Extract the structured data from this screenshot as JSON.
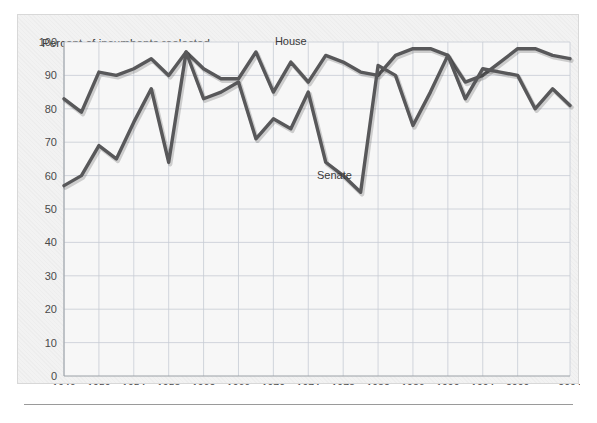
{
  "chart_data": {
    "type": "line",
    "title": "Percent of incumbents reelected",
    "xlabel": "",
    "ylabel": "",
    "ylim": [
      0,
      100
    ],
    "ytick_step": 10,
    "yticks": [
      0,
      10,
      20,
      30,
      40,
      50,
      60,
      70,
      80,
      90,
      100
    ],
    "xlim": [
      1946,
      2004
    ],
    "xtick_labels": [
      "1946",
      "1950",
      "1954",
      "1958",
      "1962",
      "1966",
      "1970",
      "1974",
      "1978",
      "1982",
      "1986",
      "1990",
      "1994",
      "2000",
      "2004"
    ],
    "xtick_values": [
      1946,
      1950,
      1954,
      1958,
      1962,
      1966,
      1970,
      1974,
      1978,
      1982,
      1986,
      1990,
      1994,
      1998,
      2004
    ],
    "x": [
      1946,
      1948,
      1950,
      1952,
      1954,
      1956,
      1958,
      1960,
      1962,
      1964,
      1966,
      1968,
      1970,
      1972,
      1974,
      1976,
      1978,
      1980,
      1982,
      1984,
      1986,
      1988,
      1990,
      1992,
      1994,
      1996,
      1998,
      2000,
      2002,
      2004
    ],
    "grid": true,
    "legend_position": "inline-annotations",
    "series": [
      {
        "name": "House",
        "label_x": 1972,
        "label_y": 99,
        "color": "#58585a",
        "values": [
          83,
          79,
          91,
          90,
          92,
          95,
          90,
          97,
          92,
          89,
          89,
          97,
          85,
          94,
          88,
          96,
          94,
          91,
          90,
          96,
          98,
          98,
          96,
          88,
          90,
          94,
          98,
          98,
          96,
          95
        ]
      },
      {
        "name": "Senate",
        "label_x": 1977,
        "label_y": 59,
        "color": "#58585a",
        "values": [
          57,
          60,
          69,
          65,
          76,
          86,
          64,
          97,
          83,
          85,
          88,
          71,
          77,
          74,
          85,
          64,
          60,
          55,
          93,
          90,
          75,
          85,
          96,
          83,
          92,
          91,
          90,
          80,
          86,
          81
        ]
      }
    ],
    "annotations": [
      {
        "text": "House",
        "x": 1972,
        "y": 99
      },
      {
        "text": "Senate",
        "x": 1977,
        "y": 59
      }
    ]
  },
  "axis": {
    "y_labels": [
      "100",
      "90",
      "80",
      "70",
      "60",
      "50",
      "40",
      "30",
      "20",
      "10",
      "0"
    ],
    "x_labels": [
      "1946",
      "1950",
      "1954",
      "1958",
      "1962",
      "1966",
      "1970",
      "1974",
      "1978",
      "1982",
      "1986",
      "1990",
      "1994",
      "2000",
      "2004"
    ]
  },
  "labels": {
    "house": "House",
    "senate": "Senate"
  },
  "colors": {
    "line": "#58585a",
    "grid": "#c6ccd4",
    "axis": "#9aa0a6",
    "panel_bg": "#f2f2f2",
    "plot_bg": "#f7f7f7",
    "text": "#3a3a3a"
  }
}
